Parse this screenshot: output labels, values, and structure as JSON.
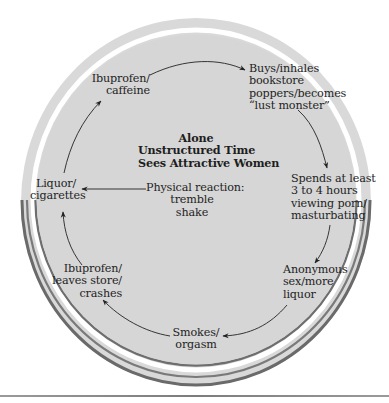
{
  "diagram": {
    "type": "cycle",
    "center": {
      "lines": [
        "Alone",
        "Unstructured Time",
        "Sees Attractive Women"
      ]
    },
    "trigger": {
      "lines": [
        "Physical reaction:",
        "tremble",
        "shake"
      ]
    },
    "nodes": [
      {
        "id": "ibuprofen-caffeine",
        "lines": [
          "Ibuprofen/",
          "caffeine"
        ]
      },
      {
        "id": "buys-poppers",
        "lines": [
          "Buys/inhales",
          "bookstore",
          "poppers/becomes",
          "“lust monster”"
        ]
      },
      {
        "id": "spends-hours",
        "lines": [
          "Spends at least",
          "3 to 4 hours",
          "viewing porn/",
          "masturbating"
        ]
      },
      {
        "id": "anonymous-sex",
        "lines": [
          "Anonymous",
          "sex/more",
          "liquor"
        ]
      },
      {
        "id": "smokes-orgasm",
        "lines": [
          "Smokes/",
          "orgasm"
        ]
      },
      {
        "id": "ibuprofen-leaves",
        "lines": [
          "Ibuprofen/",
          "leaves store/",
          "crashes"
        ]
      },
      {
        "id": "liquor-cigarettes",
        "lines": [
          "Liquor/",
          "cigarettes"
        ]
      }
    ],
    "edges": [
      {
        "from": "ibuprofen-caffeine",
        "to": "buys-poppers"
      },
      {
        "from": "buys-poppers",
        "to": "spends-hours"
      },
      {
        "from": "spends-hours",
        "to": "anonymous-sex"
      },
      {
        "from": "anonymous-sex",
        "to": "smokes-orgasm"
      },
      {
        "from": "smokes-orgasm",
        "to": "ibuprofen-leaves"
      },
      {
        "from": "ibuprofen-leaves",
        "to": "liquor-cigarettes"
      },
      {
        "from": "liquor-cigarettes",
        "to": "ibuprofen-caffeine"
      },
      {
        "from": "trigger",
        "to": "liquor-cigarettes"
      }
    ],
    "colors": {
      "disc_fill": "#d6d6d6",
      "ring_fill": "#d9d9d9",
      "ring_shadow": "#6a6a6a",
      "arrow": "#222222",
      "text": "#1e1e1e"
    }
  }
}
